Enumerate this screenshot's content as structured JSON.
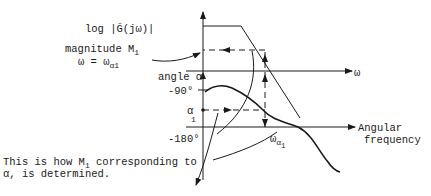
{
  "diagram": {
    "magnitude_axis_label": "log |Ḡ(jω)|",
    "magnitude_label": "magnitude M",
    "magnitude_label_sub": "1",
    "omega_eq": "ω = ω",
    "omega_eq_sub": "α1",
    "omega_axis_label": "ω",
    "angle_label": "angle α",
    "tick_minus90": "-90°",
    "tick_minus180": "-180°",
    "alpha1_label": "α",
    "alpha1_sub": "1",
    "omega_alpha1_label": "ω",
    "omega_alpha1_sub": "α",
    "omega_alpha1_sub2": "1",
    "angular_frequency_line1": "Angular",
    "angular_frequency_line2": "frequency",
    "caption_line1_a": "This is how M",
    "caption_line1_sub": "1",
    "caption_line1_b": " corresponding to",
    "caption_line2": "α, is determined."
  }
}
